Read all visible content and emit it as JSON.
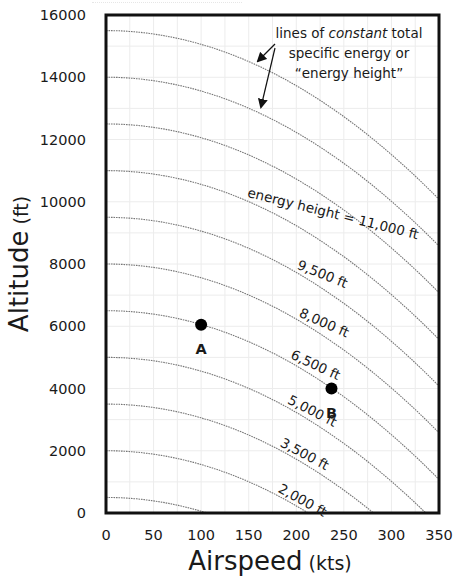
{
  "chart_data": {
    "type": "line",
    "title": "",
    "xlabel": "Airspeed",
    "xlabel_units": "(kts)",
    "ylabel": "Altitude",
    "ylabel_units": "(ft)",
    "xlim": [
      0,
      350
    ],
    "ylim": [
      0,
      16000
    ],
    "x_ticks": [
      0,
      50,
      100,
      150,
      200,
      250,
      300,
      350
    ],
    "y_ticks": [
      0,
      2000,
      4000,
      6000,
      8000,
      10000,
      12000,
      14000,
      16000
    ],
    "x_tick_labels": [
      "0",
      "50",
      "100",
      "150",
      "200",
      "250",
      "300",
      "350"
    ],
    "y_tick_labels": [
      "0",
      "2000",
      "4000",
      "6000",
      "8000",
      "10000",
      "12000",
      "14000",
      "16000"
    ],
    "grid": true,
    "legend": null,
    "relationship": "altitude = energy_height - V^2 / (2g), V in ft/s (1 kt = 1.68781 ft/s, g = 32.174 ft/s^2)",
    "series": [
      {
        "name": "energy height 500 ft",
        "energy_height_ft": 500,
        "x": [
          0,
          50,
          100,
          106
        ],
        "y": [
          500,
          389,
          57,
          0
        ]
      },
      {
        "name": "energy height 2,000 ft",
        "energy_height_ft": 2000,
        "x": [
          0,
          50,
          100,
          150,
          200,
          212
        ],
        "y": [
          2000,
          889,
          1557,
          1004,
          229,
          0
        ]
      },
      {
        "name": "energy height 3,500 ft",
        "energy_height_ft": 3500,
        "x": [
          0,
          50,
          100,
          150,
          200,
          250,
          281
        ],
        "y": [
          3500,
          3389,
          3057,
          2504,
          1729,
          733,
          0
        ]
      },
      {
        "name": "energy height 5,000 ft",
        "energy_height_ft": 5000,
        "x": [
          0,
          50,
          100,
          150,
          200,
          250,
          300,
          336
        ],
        "y": [
          5000,
          4889,
          4557,
          4004,
          3229,
          2233,
          1016,
          0
        ]
      },
      {
        "name": "energy height 6,500 ft",
        "energy_height_ft": 6500,
        "x": [
          0,
          50,
          100,
          150,
          200,
          250,
          300,
          350
        ],
        "y": [
          6500,
          6389,
          6057,
          5504,
          4729,
          3733,
          2516,
          1077
        ]
      },
      {
        "name": "energy height 8,000 ft",
        "energy_height_ft": 8000,
        "x": [
          0,
          50,
          100,
          150,
          200,
          250,
          300,
          350
        ],
        "y": [
          8000,
          7889,
          7557,
          7004,
          6229,
          5233,
          4016,
          2577
        ]
      },
      {
        "name": "energy height 9,500 ft",
        "energy_height_ft": 9500,
        "x": [
          0,
          50,
          100,
          150,
          200,
          250,
          300,
          350
        ],
        "y": [
          9500,
          9389,
          9057,
          8504,
          7729,
          6733,
          5516,
          4077
        ]
      },
      {
        "name": "energy height 11,000 ft",
        "energy_height_ft": 11000,
        "x": [
          0,
          50,
          100,
          150,
          200,
          250,
          300,
          350
        ],
        "y": [
          11000,
          10889,
          10557,
          10004,
          9229,
          8233,
          7016,
          5577
        ]
      },
      {
        "name": "energy height 12,500 ft",
        "energy_height_ft": 12500,
        "x": [
          0,
          50,
          100,
          150,
          200,
          250,
          300,
          350
        ],
        "y": [
          12500,
          12389,
          12057,
          11504,
          10729,
          9733,
          8516,
          7077
        ]
      },
      {
        "name": "energy height 14,000 ft",
        "energy_height_ft": 14000,
        "x": [
          0,
          50,
          100,
          150,
          200,
          250,
          300,
          350
        ],
        "y": [
          14000,
          13889,
          13557,
          13004,
          12229,
          11233,
          10016,
          8577
        ]
      },
      {
        "name": "energy height 15,500 ft",
        "energy_height_ft": 15500,
        "x": [
          0,
          50,
          100,
          150,
          200,
          250,
          300,
          350
        ],
        "y": [
          15500,
          15389,
          15057,
          14504,
          13729,
          12733,
          11516,
          10077
        ]
      }
    ],
    "points": [
      {
        "label": "A",
        "x": 100,
        "y": 6050,
        "on_curve_ft": 6500
      },
      {
        "label": "B",
        "x": 237,
        "y": 4000,
        "on_curve_ft": 6500
      }
    ],
    "curve_labels": [
      {
        "text": "energy height = 11,000 ft",
        "energy_height_ft": 11000,
        "x": 148,
        "angle": 14
      },
      {
        "text": "9,500 ft",
        "energy_height_ft": 9500,
        "x": 200,
        "angle": 22
      },
      {
        "text": "8,000 ft",
        "energy_height_ft": 8000,
        "x": 202,
        "angle": 24
      },
      {
        "text": "6,500 ft",
        "energy_height_ft": 6500,
        "x": 193,
        "angle": 25
      },
      {
        "text": "5,000 ft",
        "energy_height_ft": 5000,
        "x": 190,
        "angle": 27
      },
      {
        "text": "3,500 ft",
        "energy_height_ft": 3500,
        "x": 182,
        "angle": 28
      },
      {
        "text": "2,000 ft",
        "energy_height_ft": 2000,
        "x": 180,
        "angle": 29
      }
    ],
    "annotations": [
      {
        "text_line_1_prefix": "lines of ",
        "text_line_1_italic": "constant",
        "text_line_1_suffix": " total",
        "text_line_2": "specific energy or",
        "text_line_3": "“energy height”",
        "arrows_to_curves_ft": [
          15500,
          14000
        ]
      }
    ]
  },
  "style": {
    "frame_color": "#111111",
    "curve_color": "#777777",
    "grid_color": "#ececec",
    "point_color": "#000000",
    "text_color": "#1a1a1a"
  }
}
